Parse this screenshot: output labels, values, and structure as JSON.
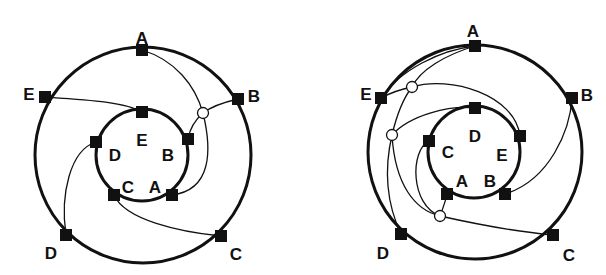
{
  "diagrams": [
    {
      "id": "left",
      "outer_circle": {
        "cx": 143,
        "cy": 155,
        "r": 108
      },
      "inner_circle": {
        "cx": 142,
        "cy": 155,
        "r": 46
      },
      "outer_nodes": [
        {
          "label": "A",
          "x": 142,
          "y": 50,
          "lx": 142,
          "ly": 38,
          "anchor": "middle"
        },
        {
          "label": "B",
          "x": 238,
          "y": 99,
          "lx": 254,
          "ly": 96,
          "anchor": "middle"
        },
        {
          "label": "C",
          "x": 221,
          "y": 236,
          "lx": 236,
          "ly": 254,
          "anchor": "middle"
        },
        {
          "label": "D",
          "x": 66,
          "y": 235,
          "lx": 51,
          "ly": 253,
          "anchor": "middle"
        },
        {
          "label": "E",
          "x": 45,
          "y": 97,
          "lx": 29,
          "ly": 94,
          "anchor": "middle"
        }
      ],
      "inner_nodes": [
        {
          "label": "E",
          "x": 142,
          "y": 112,
          "lx": 142,
          "ly": 140,
          "anchor": "middle"
        },
        {
          "label": "B",
          "x": 188,
          "y": 139,
          "lx": 168,
          "ly": 155,
          "anchor": "middle"
        },
        {
          "label": "A",
          "x": 172,
          "y": 195,
          "lx": 155,
          "ly": 187,
          "anchor": "middle"
        },
        {
          "label": "C",
          "x": 114,
          "y": 195,
          "lx": 128,
          "ly": 187,
          "anchor": "middle"
        },
        {
          "label": "D",
          "x": 96,
          "y": 142,
          "lx": 115,
          "ly": 155,
          "anchor": "middle"
        }
      ],
      "junctions": [
        {
          "x": 203,
          "y": 113
        }
      ],
      "connections": [
        {
          "path": "M 45 97 C 90 100, 125 102, 142 112"
        },
        {
          "path": "M 142 50 C 175 60, 195 85, 203 113"
        },
        {
          "path": "M 238 99 C 225 102, 212 106, 203 113"
        },
        {
          "path": "M 203 113 C 195 120, 190 128, 188 139"
        },
        {
          "path": "M 203 113 C 212 150, 212 190, 172 195"
        },
        {
          "path": "M 66 235 C 60 195, 70 150, 96 142"
        },
        {
          "path": "M 114 195 C 125 220, 180 232, 221 236"
        }
      ]
    },
    {
      "id": "right",
      "outer_circle": {
        "cx": 475,
        "cy": 152,
        "r": 107
      },
      "inner_circle": {
        "cx": 474,
        "cy": 152,
        "r": 46
      },
      "outer_nodes": [
        {
          "label": "A",
          "x": 475,
          "y": 46,
          "lx": 473,
          "ly": 31,
          "anchor": "middle"
        },
        {
          "label": "B",
          "x": 572,
          "y": 98,
          "lx": 587,
          "ly": 95,
          "anchor": "middle"
        },
        {
          "label": "C",
          "x": 553,
          "y": 235,
          "lx": 569,
          "ly": 255,
          "anchor": "middle"
        },
        {
          "label": "D",
          "x": 401,
          "y": 234,
          "lx": 383,
          "ly": 253,
          "anchor": "middle"
        },
        {
          "label": "E",
          "x": 381,
          "y": 98,
          "lx": 366,
          "ly": 94,
          "anchor": "middle"
        }
      ],
      "inner_nodes": [
        {
          "label": "D",
          "x": 475,
          "y": 108,
          "lx": 475,
          "ly": 136,
          "anchor": "middle"
        },
        {
          "label": "E",
          "x": 520,
          "y": 136,
          "lx": 502,
          "ly": 155,
          "anchor": "middle"
        },
        {
          "label": "B",
          "x": 505,
          "y": 194,
          "lx": 490,
          "ly": 181,
          "anchor": "middle"
        },
        {
          "label": "A",
          "x": 447,
          "y": 194,
          "lx": 462,
          "ly": 181,
          "anchor": "middle"
        },
        {
          "label": "C",
          "x": 429,
          "y": 141,
          "lx": 448,
          "ly": 152,
          "anchor": "middle"
        }
      ],
      "junctions": [
        {
          "x": 412,
          "y": 87
        },
        {
          "x": 392,
          "y": 135
        },
        {
          "x": 440,
          "y": 216
        }
      ],
      "connections": [
        {
          "path": "M 475 46 C 440 50, 400 70, 381 98"
        },
        {
          "path": "M 475 46 C 445 55, 420 70, 412 87"
        },
        {
          "path": "M 381 98 C 392 92, 402 89, 412 87"
        },
        {
          "path": "M 412 87 C 450 75, 515 95, 520 136"
        },
        {
          "path": "M 412 87 C 402 100, 396 118, 392 135"
        },
        {
          "path": "M 392 135 C 410 115, 450 105, 475 108"
        },
        {
          "path": "M 392 135 C 385 165, 385 200, 401 234"
        },
        {
          "path": "M 392 135 C 395 185, 415 210, 440 216"
        },
        {
          "path": "M 429 141 C 410 150, 410 205, 440 216"
        },
        {
          "path": "M 440 216 C 443 208, 446 200, 447 194"
        },
        {
          "path": "M 440 216 C 480 225, 520 232, 553 235"
        },
        {
          "path": "M 505 194 C 550 180, 570 130, 572 98"
        }
      ]
    }
  ]
}
